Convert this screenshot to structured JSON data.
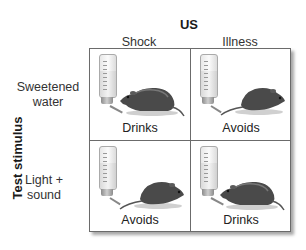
{
  "figure": {
    "top_axis_label": "US",
    "left_axis_label": "Test stimulus",
    "columns": [
      {
        "label": "Shock"
      },
      {
        "label": "Illness"
      }
    ],
    "rows": [
      {
        "label_line1": "Sweetened",
        "label_line2": "water"
      },
      {
        "label_line1": "Light +",
        "label_line2": "sound"
      }
    ],
    "cells": [
      {
        "row": 0,
        "col": 0,
        "outcome": "Drinks",
        "icons": [
          "water-bottle-icon",
          "rat-drinking-icon"
        ]
      },
      {
        "row": 0,
        "col": 1,
        "outcome": "Avoids",
        "icons": [
          "water-bottle-icon",
          "rat-avoiding-icon"
        ]
      },
      {
        "row": 1,
        "col": 0,
        "outcome": "Avoids",
        "icons": [
          "water-bottle-icon",
          "rat-avoiding-icon"
        ]
      },
      {
        "row": 1,
        "col": 1,
        "outcome": "Drinks",
        "icons": [
          "water-bottle-icon",
          "rat-drinking-icon"
        ]
      }
    ]
  }
}
